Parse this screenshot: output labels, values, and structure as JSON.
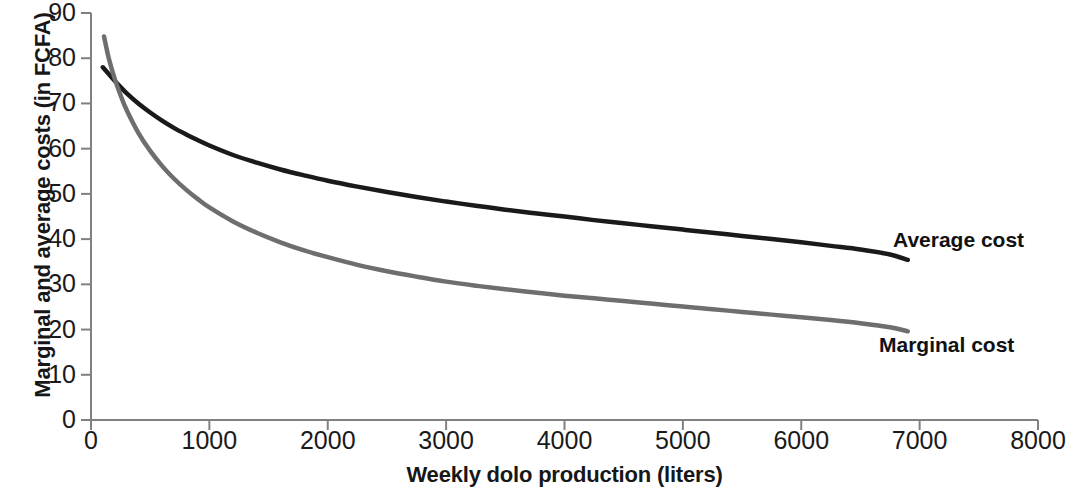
{
  "chart_data": {
    "type": "line",
    "title": "",
    "subtitle": "",
    "xlabel": "Weekly dolo production (liters)",
    "ylabel": "Marginal and average costs (in FCFA)",
    "xlim": [
      0,
      8000
    ],
    "ylim": [
      0,
      90
    ],
    "xticks": [
      0,
      1000,
      2000,
      3000,
      4000,
      5000,
      6000,
      7000,
      8000
    ],
    "yticks": [
      0,
      10,
      20,
      30,
      40,
      50,
      60,
      70,
      80,
      90
    ],
    "xtick_labels": [
      "0",
      "1000",
      "2000",
      "3000",
      "4000",
      "5000",
      "6000",
      "7000",
      "8000"
    ],
    "ytick_labels": [
      "0",
      "10",
      "20",
      "30",
      "40",
      "50",
      "60",
      "70",
      "80",
      "90"
    ],
    "grid": false,
    "legend_position": "inline-annotations",
    "series": [
      {
        "name": "Average cost",
        "color": "#1a1a1a",
        "label_text": "Average cost",
        "x": [
          100,
          150,
          200,
          250,
          300,
          400,
          500,
          600,
          700,
          800,
          900,
          1000,
          1200,
          1400,
          1600,
          1800,
          2000,
          2250,
          2500,
          2750,
          3000,
          3250,
          3500,
          3750,
          4000,
          4250,
          4500,
          4750,
          5000,
          5250,
          5500,
          5750,
          6000,
          6250,
          6500,
          6750,
          6900
        ],
        "y": [
          78.0,
          76.5,
          75.0,
          73.6,
          72.3,
          70.0,
          68.0,
          66.2,
          64.6,
          63.2,
          61.9,
          60.7,
          58.6,
          56.9,
          55.4,
          54.1,
          52.9,
          51.6,
          50.4,
          49.3,
          48.3,
          47.4,
          46.5,
          45.7,
          45.0,
          44.2,
          43.5,
          42.8,
          42.1,
          41.4,
          40.7,
          40.0,
          39.3,
          38.5,
          37.7,
          36.6,
          35.4
        ]
      },
      {
        "name": "Marginal cost",
        "color": "#6e6e6e",
        "label_text": "Marginal cost",
        "x": [
          110,
          150,
          200,
          250,
          300,
          400,
          500,
          600,
          700,
          800,
          900,
          1000,
          1200,
          1400,
          1600,
          1800,
          2000,
          2250,
          2500,
          2750,
          3000,
          3250,
          3500,
          3750,
          4000,
          4250,
          4500,
          4750,
          5000,
          5250,
          5500,
          5750,
          6000,
          6250,
          6500,
          6750,
          6900
        ],
        "y": [
          84.8,
          80.0,
          75.5,
          71.8,
          68.6,
          63.5,
          59.5,
          56.2,
          53.4,
          51.0,
          48.9,
          47.0,
          43.9,
          41.4,
          39.3,
          37.5,
          36.0,
          34.3,
          32.9,
          31.7,
          30.6,
          29.7,
          28.9,
          28.2,
          27.5,
          26.9,
          26.3,
          25.7,
          25.1,
          24.5,
          23.9,
          23.3,
          22.7,
          22.1,
          21.4,
          20.5,
          19.6
        ]
      }
    ]
  },
  "axes": {
    "y_title": "Marginal and average costs (in FCFA)",
    "x_title": "Weekly dolo production (liters)"
  }
}
